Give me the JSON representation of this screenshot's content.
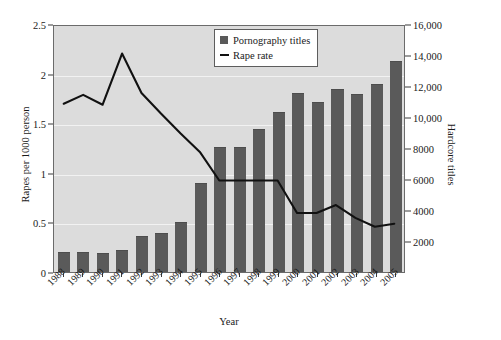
{
  "chart_data": {
    "type": "bar",
    "title": "",
    "xlabel": "Year",
    "ylabel": "Rapes per 1000 person",
    "y2label": "Hardcore titles",
    "grid": true,
    "legend_position": "top-right",
    "categories": [
      "1988",
      "1989",
      "1990",
      "1991",
      "1992",
      "1993",
      "1994",
      "1995",
      "1996",
      "1997",
      "1998",
      "1999",
      "2000",
      "2001",
      "2002",
      "2003",
      "2004",
      "2005"
    ],
    "ylim": [
      0,
      2.5
    ],
    "y2lim": [
      0,
      16000
    ],
    "ytick_labels": [
      "0",
      "0.5",
      "1",
      "1.5",
      "2",
      "2.5"
    ],
    "ytick_values": [
      0,
      0.5,
      1,
      1.5,
      2,
      2.5
    ],
    "y2tick_labels": [
      "2000",
      "4000",
      "6000",
      "8000",
      "10,000",
      "12,000",
      "14,000",
      "16,000"
    ],
    "y2tick_values": [
      2000,
      4000,
      6000,
      8000,
      10000,
      12000,
      14000,
      16000
    ],
    "series": [
      {
        "name": "Pornography titles",
        "type": "bar",
        "axis": "right",
        "unit": "hardcore titles",
        "color": "#5a5a5a",
        "values": [
          1300,
          1300,
          1250,
          1450,
          2300,
          2500,
          3200,
          5750,
          8050,
          8050,
          9200,
          10300,
          11550,
          11000,
          11800,
          11500,
          12100,
          13600
        ],
        "values_left_axis_equivalent": [
          0.2,
          0.2,
          0.2,
          0.23,
          0.36,
          0.39,
          0.5,
          0.9,
          1.26,
          1.26,
          1.44,
          1.61,
          1.8,
          1.72,
          1.84,
          1.8,
          1.89,
          2.13
        ]
      },
      {
        "name": "Rape rate",
        "type": "line",
        "axis": "left",
        "unit": "rapes per 1000 person",
        "color": "#111111",
        "values": [
          1.71,
          1.8,
          1.7,
          2.22,
          1.82,
          1.61,
          1.41,
          1.22,
          0.93,
          0.93,
          0.93,
          0.93,
          0.6,
          0.6,
          0.68,
          0.55,
          0.46,
          0.49
        ]
      }
    ]
  },
  "legend": {
    "items": [
      {
        "label": "Pornography titles",
        "marker": "square-swatch"
      },
      {
        "label": "Rape rate",
        "marker": "line-swatch"
      }
    ]
  },
  "axes": {
    "left_title": "Rapes per 1000 person",
    "right_title": "Hardcore titles",
    "bottom_title": "Year"
  },
  "colors": {
    "bar": "#5a5a5a",
    "line": "#111111",
    "plot_background": "#dcdcdc",
    "gridline": "#f2f2f2",
    "frame": "#6b6b6b",
    "page_background": "#ffffff"
  }
}
